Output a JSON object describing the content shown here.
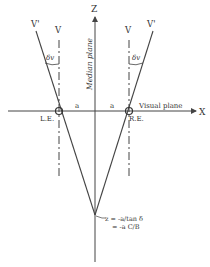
{
  "diagram": {
    "type": "binocular-geometry",
    "axes": {
      "z_label": "Z",
      "x_label": "X",
      "median_plane_label": "Median plane",
      "visual_plane_label": "Visual plane"
    },
    "eyes": {
      "left": "L.E.",
      "right": "R.E."
    },
    "distances": {
      "left_a": "a",
      "right_a": "a"
    },
    "lines": {
      "left_v": "V",
      "left_v_prime": "V'",
      "right_v": "V",
      "right_v_prime": "V'"
    },
    "angles": {
      "left": "δv",
      "right": "δv"
    },
    "equation": {
      "line1": "z = -a/tan δ",
      "line2": "= -a C/B"
    },
    "colors": {
      "line": "#444444",
      "text": "#333333",
      "background": "#ffffff"
    }
  }
}
